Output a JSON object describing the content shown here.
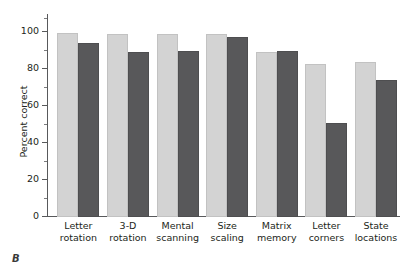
{
  "panel": {
    "label": "B"
  },
  "chart_data": {
    "type": "bar",
    "title": "",
    "xlabel": "",
    "ylabel": "Percent correct",
    "ylim": [
      0,
      100
    ],
    "yticks": [
      0,
      20,
      40,
      60,
      80,
      100
    ],
    "ytick_labels": [
      "0",
      "20",
      "40",
      "60",
      "80",
      "100"
    ],
    "yminor_ticks": [
      10,
      30,
      50,
      70,
      90
    ],
    "grid": false,
    "legend": "none",
    "categories": [
      "Letter rotation",
      "3-D rotation",
      "Mental scanning",
      "Size scaling",
      "Matrix memory",
      "Letter corners",
      "State locations"
    ],
    "category_lines": [
      [
        "Letter",
        "rotation"
      ],
      [
        "3-D",
        "rotation"
      ],
      [
        "Mental",
        "scanning"
      ],
      [
        "Size",
        "scaling"
      ],
      [
        "Matrix",
        "memory"
      ],
      [
        "Letter",
        "corners"
      ],
      [
        "State",
        "locations"
      ]
    ],
    "series": [
      {
        "name": "light",
        "color": "#d3d3d3",
        "values": [
          99.5,
          99,
          99,
          99,
          89,
          82.5,
          84
        ]
      },
      {
        "name": "dark",
        "color": "#58585a",
        "values": [
          94,
          89,
          89.5,
          97.5,
          90,
          51,
          74
        ]
      }
    ]
  }
}
